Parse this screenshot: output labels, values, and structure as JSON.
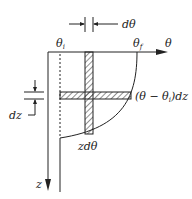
{
  "diagram": {
    "labels": {
      "d_theta": "dθ",
      "theta_i": "θ",
      "theta_i_sub": "i",
      "theta_f": "θ",
      "theta_f_sub": "f",
      "theta_axis": "θ",
      "dz": "dz",
      "horizontal_strip": "(θ − θ",
      "horizontal_strip_sub": "i",
      "horizontal_strip_tail": ")dz",
      "vertical_strip": "zdθ",
      "z_axis": "z"
    },
    "colors": {
      "line": "#222222",
      "background": "#ffffff"
    }
  }
}
